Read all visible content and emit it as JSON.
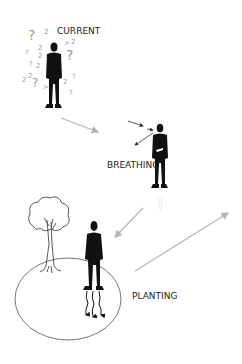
{
  "diagram": {
    "stages": [
      {
        "id": "current",
        "label": "CURRENT"
      },
      {
        "id": "breathing",
        "label": "BREATHING"
      },
      {
        "id": "planting",
        "label": "PLANTING"
      }
    ],
    "colors": {
      "figure": "#111111",
      "arrow": "#b5b5b5",
      "outline": "#777777",
      "question_marks": "#9a9a9a"
    }
  }
}
